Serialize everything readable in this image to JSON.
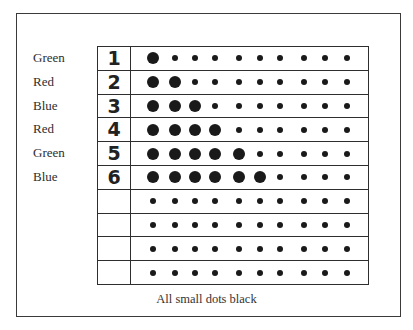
{
  "figure": {
    "caption": "All small dots black",
    "row_labels": [
      "Green",
      "Red",
      "Blue",
      "Red",
      "Green",
      "Blue",
      "",
      "",
      "",
      ""
    ],
    "row_numbers": [
      "1",
      "2",
      "3",
      "4",
      "5",
      "6",
      "",
      "",
      "",
      ""
    ],
    "dots_per_row": 10,
    "large_dots_per_row": [
      1,
      2,
      3,
      4,
      5,
      6,
      0,
      0,
      0,
      0
    ],
    "dot_x_positions": [
      22,
      44,
      64,
      84,
      108,
      129,
      149,
      173,
      194,
      216
    ],
    "colors": {
      "dot": "#1a1a1a",
      "line": "#2e2e2e",
      "background": "#ffffff"
    }
  }
}
